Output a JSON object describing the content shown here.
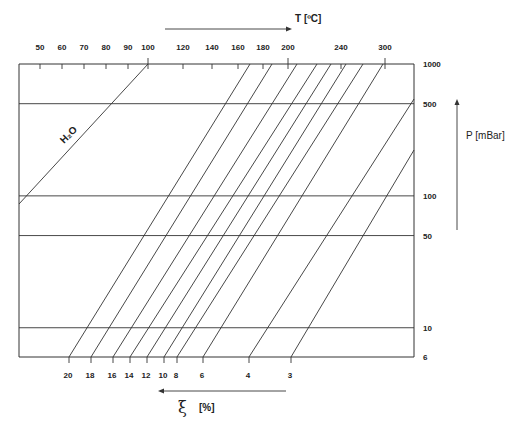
{
  "chart_data": {
    "type": "line",
    "title": "",
    "top_axis": {
      "label": "T [ºC]",
      "ticks": [
        50,
        60,
        70,
        80,
        90,
        100,
        120,
        140,
        160,
        180,
        200,
        240,
        300
      ],
      "tick_labels": [
        "50",
        "60",
        "70",
        "80",
        "90",
        "100",
        "120",
        "140",
        "160",
        "180",
        "200",
        "240",
        "300"
      ],
      "arrow_direction": "right"
    },
    "right_axis": {
      "label": "P [mBar]",
      "scale": "log",
      "ticks": [
        1000,
        500,
        100,
        50,
        10,
        6
      ],
      "tick_labels": [
        "1000",
        "500",
        "100",
        "50",
        "10",
        "6"
      ],
      "range": [
        6,
        1000
      ],
      "arrow_direction": "up"
    },
    "bottom_axis": {
      "label": "ξ [%]",
      "symbol": "ξ",
      "unit": "[%]",
      "ticks": [
        20,
        18,
        16,
        14,
        12,
        10,
        8,
        6,
        4,
        3
      ],
      "tick_labels": [
        "20",
        "18",
        "16",
        "14",
        "12",
        "10",
        "8",
        "6",
        "4",
        "3"
      ],
      "arrow_direction": "left"
    },
    "gridlines_mbar": [
      500,
      100,
      50,
      10
    ],
    "annotations": [
      {
        "text": "H₂O",
        "series": "H2O"
      }
    ],
    "series": [
      {
        "name": "H2O",
        "label": "H₂O",
        "t_at_1000mbar": 100
      },
      {
        "name": "ξ=20%",
        "xi": 20
      },
      {
        "name": "ξ=18%",
        "xi": 18
      },
      {
        "name": "ξ=16%",
        "xi": 16
      },
      {
        "name": "ξ=14%",
        "xi": 14
      },
      {
        "name": "ξ=12%",
        "xi": 12
      },
      {
        "name": "ξ=10%",
        "xi": 10
      },
      {
        "name": "ξ=8%",
        "xi": 8
      },
      {
        "name": "ξ=6%",
        "xi": 6
      },
      {
        "name": "ξ=4%",
        "xi": 4
      },
      {
        "name": "ξ=3%",
        "xi": 3
      }
    ]
  }
}
